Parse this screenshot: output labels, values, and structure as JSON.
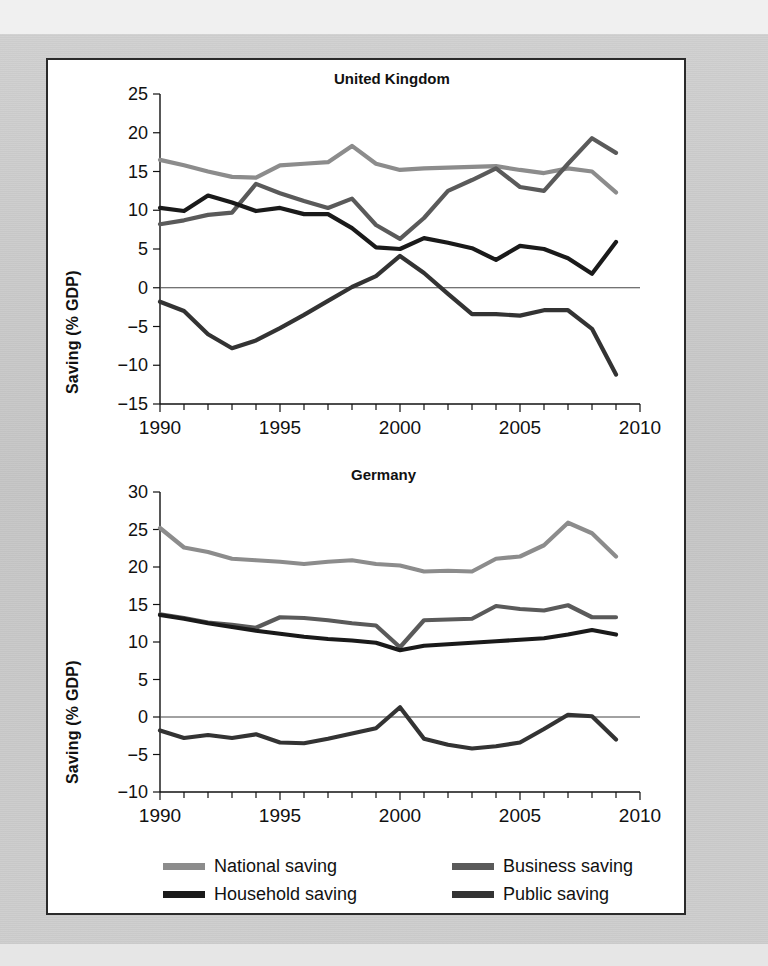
{
  "figure": {
    "ylabel": "Saving (% GDP)",
    "series_colors": {
      "national": "#8c8c8c",
      "business": "#5a5a5a",
      "household": "#1a1a1a",
      "public": "#333333"
    },
    "legend": {
      "items": [
        {
          "key": "national",
          "label": "National saving",
          "color": "#8c8c8c"
        },
        {
          "key": "business",
          "label": "Business saving",
          "color": "#5a5a5a"
        },
        {
          "key": "household",
          "label": "Household saving",
          "color": "#1a1a1a"
        },
        {
          "key": "public",
          "label": "Public saving",
          "color": "#333333"
        }
      ]
    }
  },
  "chart_data": [
    {
      "type": "line",
      "title": "United Kingdom",
      "xlabel": "",
      "ylabel": "Saving (% GDP)",
      "xlim": [
        1990,
        2010
      ],
      "ylim": [
        -15,
        25
      ],
      "ytick_step": 5,
      "yticks": [
        -15,
        -10,
        -5,
        0,
        5,
        10,
        15,
        20,
        25
      ],
      "xticks_major": [
        1990,
        1995,
        2000,
        2005,
        2010
      ],
      "xticks_minor_step": 1,
      "grid": false,
      "zero_line": true,
      "legend_position": "below-figure",
      "x": [
        1990,
        1991,
        1992,
        1993,
        1994,
        1995,
        1996,
        1997,
        1998,
        1999,
        2000,
        2001,
        2002,
        2003,
        2004,
        2005,
        2006,
        2007,
        2008,
        2009
      ],
      "series": [
        {
          "name": "National saving",
          "color": "#8c8c8c",
          "values": [
            16.5,
            15.8,
            15.0,
            14.3,
            14.2,
            15.8,
            16.0,
            16.2,
            18.3,
            16.0,
            15.2,
            15.4,
            15.5,
            15.6,
            15.7,
            15.2,
            14.8,
            15.4,
            15.0,
            12.3
          ]
        },
        {
          "name": "Business saving",
          "color": "#5a5a5a",
          "values": [
            8.2,
            8.7,
            9.4,
            9.7,
            13.4,
            12.2,
            11.2,
            10.3,
            11.5,
            8.1,
            6.3,
            9.0,
            12.5,
            13.9,
            15.4,
            13.0,
            12.5,
            16.0,
            19.3,
            17.4
          ]
        },
        {
          "name": "Household saving",
          "color": "#1a1a1a",
          "values": [
            10.3,
            9.9,
            11.9,
            11.0,
            9.9,
            10.3,
            9.5,
            9.5,
            7.7,
            5.2,
            5.0,
            6.4,
            5.8,
            5.1,
            3.6,
            5.4,
            5.0,
            3.8,
            1.8,
            5.9
          ]
        },
        {
          "name": "Public saving",
          "color": "#333333",
          "values": [
            -1.8,
            -3.0,
            -6.0,
            -7.8,
            -6.8,
            -5.2,
            -3.5,
            -1.7,
            0.1,
            1.5,
            4.1,
            1.9,
            -0.8,
            -3.4,
            -3.4,
            -3.6,
            -2.9,
            -2.9,
            -5.3,
            -11.2
          ]
        }
      ]
    },
    {
      "type": "line",
      "title": "Germany",
      "xlabel": "",
      "ylabel": "Saving (% GDP)",
      "xlim": [
        1990,
        2010
      ],
      "ylim": [
        -10,
        30
      ],
      "ytick_step": 5,
      "yticks": [
        -10,
        -5,
        0,
        5,
        10,
        15,
        20,
        25,
        30
      ],
      "xticks_major": [
        1990,
        1995,
        2000,
        2005,
        2010
      ],
      "xticks_minor_step": 1,
      "grid": false,
      "zero_line": true,
      "legend_position": "below-figure",
      "x": [
        1990,
        1991,
        1992,
        1993,
        1994,
        1995,
        1996,
        1997,
        1998,
        1999,
        2000,
        2001,
        2002,
        2003,
        2004,
        2005,
        2006,
        2007,
        2008,
        2009
      ],
      "series": [
        {
          "name": "National saving",
          "color": "#8c8c8c",
          "values": [
            25.2,
            22.6,
            22.0,
            21.1,
            20.9,
            20.7,
            20.4,
            20.7,
            20.9,
            20.4,
            20.2,
            19.4,
            19.5,
            19.4,
            21.1,
            21.4,
            22.9,
            25.9,
            24.5,
            21.4
          ]
        },
        {
          "name": "Business saving",
          "color": "#5a5a5a",
          "values": [
            13.7,
            13.2,
            12.6,
            12.3,
            11.9,
            13.3,
            13.2,
            12.9,
            12.5,
            12.2,
            9.3,
            12.9,
            13.0,
            13.1,
            14.8,
            14.4,
            14.2,
            14.9,
            13.3,
            13.3
          ]
        },
        {
          "name": "Household saving",
          "color": "#1a1a1a",
          "values": [
            13.6,
            13.1,
            12.5,
            12.0,
            11.5,
            11.1,
            10.7,
            10.4,
            10.2,
            9.9,
            8.9,
            9.5,
            9.7,
            9.9,
            10.1,
            10.3,
            10.5,
            11.0,
            11.6,
            11.0
          ]
        },
        {
          "name": "Public saving",
          "color": "#333333",
          "values": [
            -1.8,
            -2.8,
            -2.4,
            -2.8,
            -2.3,
            -3.4,
            -3.5,
            -2.9,
            -2.2,
            -1.5,
            1.3,
            -2.9,
            -3.7,
            -4.2,
            -3.9,
            -3.4,
            -1.6,
            0.3,
            0.1,
            -3.0
          ]
        }
      ]
    }
  ]
}
